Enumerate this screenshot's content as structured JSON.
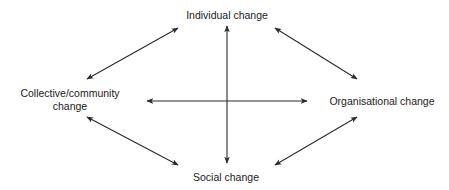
{
  "diagram": {
    "nodes": [
      {
        "id": "individual",
        "label": "Individual change"
      },
      {
        "id": "collective",
        "label_line1": "Collective/community",
        "label_line2": "change"
      },
      {
        "id": "organisational",
        "label": "Organisational change"
      },
      {
        "id": "social",
        "label": "Social change"
      }
    ],
    "edges": [
      {
        "from": "individual",
        "to": "collective",
        "type": "bidirectional"
      },
      {
        "from": "individual",
        "to": "organisational",
        "type": "bidirectional"
      },
      {
        "from": "collective",
        "to": "social",
        "type": "bidirectional"
      },
      {
        "from": "organisational",
        "to": "social",
        "type": "bidirectional"
      },
      {
        "from": "individual",
        "to": "social",
        "type": "bidirectional",
        "style": "vertical-axis"
      },
      {
        "from": "collective",
        "to": "organisational",
        "type": "bidirectional",
        "style": "horizontal-axis"
      }
    ],
    "colors": {
      "line": "#2a2a2a",
      "text": "#1a1a1a",
      "background": "#ffffff"
    }
  }
}
